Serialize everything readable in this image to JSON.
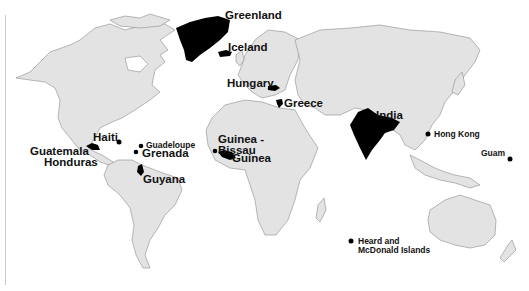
{
  "map": {
    "projection": "world-robinson",
    "colors": {
      "ocean": "#ffffff",
      "land": "#e3e3e3",
      "border": "#8c8c8c",
      "highlight": "#000000",
      "label": "#111111"
    },
    "labels": {
      "greenland": "Greenland",
      "iceland": "Iceland",
      "hungary": "Hungary",
      "greece": "Greece",
      "india": "India",
      "hong_kong": "Hong Kong",
      "guam": "Guam",
      "haiti": "Haiti",
      "guadeloupe": "Guadeloupe",
      "grenada": "Grenada",
      "guatemala": "Guatemala",
      "honduras": "Honduras",
      "guyana": "Guyana",
      "guinea_bissau_1": "Guinea -",
      "guinea_bissau_2": "Bissau",
      "guinea": "Guinea",
      "heard_1": "Heard and",
      "heard_2": "McDonald Islands"
    },
    "highlighted_countries": [
      "Greenland",
      "Iceland",
      "Hungary",
      "Greece",
      "India",
      "Hong Kong",
      "Guam",
      "Haiti",
      "Guadeloupe",
      "Grenada",
      "Guatemala",
      "Honduras",
      "Guyana",
      "Guinea-Bissau",
      "Guinea",
      "Heard and McDonald Islands"
    ]
  }
}
